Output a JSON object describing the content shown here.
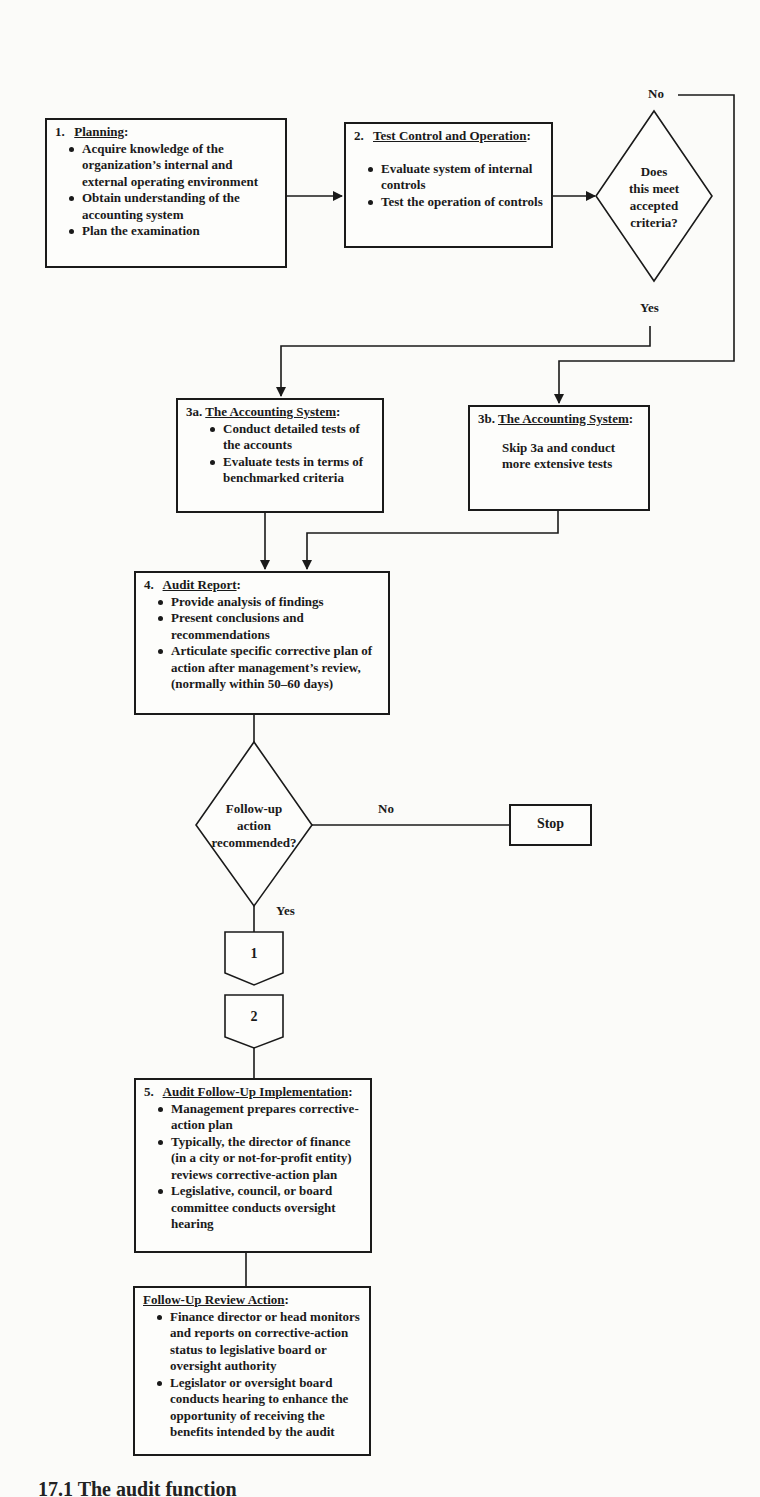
{
  "steps": {
    "planning": {
      "number": "1.",
      "title": "Planning",
      "items": [
        "Acquire knowledge of the organization’s internal and external operating environment",
        "Obtain understanding of the accounting system",
        "Plan the examination"
      ]
    },
    "test_control": {
      "number": "2.",
      "title": "Test Control and Operation",
      "items": [
        "Evaluate system of internal controls",
        "Test the operation of controls"
      ]
    },
    "decision_criteria": {
      "question": "Does this meet accepted criteria?",
      "lines": [
        "Does",
        "this meet",
        "accepted",
        "criteria?"
      ],
      "yes_label": "Yes",
      "no_label": "No"
    },
    "accounting_3a": {
      "number": "3a.",
      "title": "The Accounting System",
      "items": [
        "Conduct detailed tests of the accounts",
        "Evaluate tests in terms of benchmarked criteria"
      ]
    },
    "accounting_3b": {
      "number": "3b.",
      "title": "The Accounting System",
      "text": "Skip 3a and conduct more extensive tests"
    },
    "audit_report": {
      "number": "4.",
      "title": "Audit Report",
      "items": [
        "Provide analysis of findings",
        "Present conclusions and recommendations",
        "Articulate specific corrective plan of action after management’s review, (normally within 50–60 days)"
      ]
    },
    "decision_followup": {
      "question": "Follow-up action recommended?",
      "lines": [
        "Follow-up",
        "action",
        "recommended?"
      ],
      "yes_label": "Yes",
      "no_label": "No"
    },
    "stop": {
      "label": "Stop"
    },
    "offpage_1": {
      "label": "1"
    },
    "offpage_2": {
      "label": "2"
    },
    "followup_implementation": {
      "number": "5.",
      "title": "Audit Follow-Up Implementation",
      "items": [
        "Management prepares corrective-action plan",
        "Typically, the director of finance (in a city or not-for-profit entity) reviews corrective-action plan",
        "Legislative, council, or board committee conducts oversight hearing"
      ]
    },
    "followup_review": {
      "title": "Follow-Up Review Action",
      "items": [
        "Finance director or head monitors and reports on corrective-action status to legislative board or oversight authority",
        "Legislator or oversight board conducts hearing to enhance the opportunity of receiving the benefits intended by the audit"
      ]
    }
  },
  "caption": {
    "text": "17.1  The audit function"
  },
  "colors": {
    "ink": "#1a1a1a",
    "paper": "#fbfbf9"
  }
}
